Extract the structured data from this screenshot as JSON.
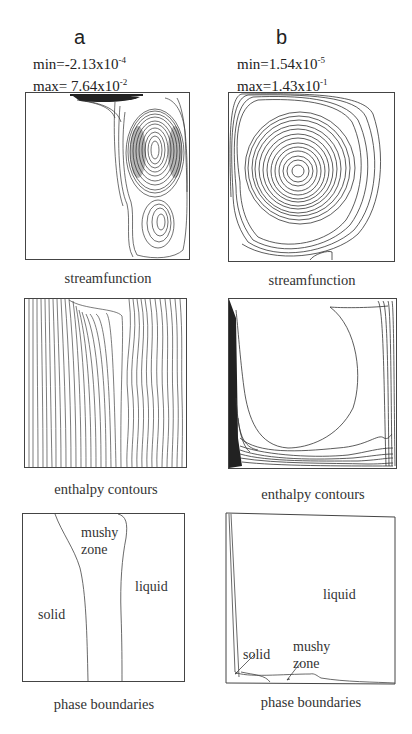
{
  "figure": {
    "columns": [
      {
        "id": "a",
        "label": "a",
        "min_prefix": "min=-2.13x10",
        "min_exp": "-4",
        "max_prefix": "max= 7.64x10",
        "max_exp": "-2",
        "captions": {
          "streamfunction": "streamfunction",
          "enthalpy": "enthalpy  contours",
          "phase": "phase  boundaries"
        },
        "regions": {
          "mushy": "mushy",
          "zone": "zone",
          "liquid": "liquid",
          "solid": "solid"
        }
      },
      {
        "id": "b",
        "label": "b",
        "min_prefix": "min=1.54x10",
        "min_exp": "-5",
        "max_prefix": "max=1.43x10",
        "max_exp": "-1",
        "captions": {
          "streamfunction": "streamfunction",
          "enthalpy": "enthalpy  contours",
          "phase": "phase  boundaries"
        },
        "regions": {
          "liquid": "liquid",
          "solid": "solid",
          "mushy": "mushy",
          "zone": "zone"
        }
      }
    ],
    "line_color": "#333333"
  }
}
